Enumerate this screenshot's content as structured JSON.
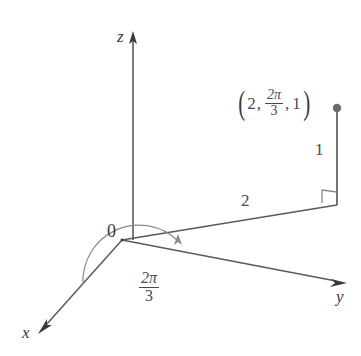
{
  "figure": {
    "background_color": "#ffffff",
    "line_color": "#5a5a5a",
    "text_color": "#3a3a3a",
    "origin_label": "0",
    "axes": [
      {
        "name": "z",
        "label": "z",
        "direction": "up"
      },
      {
        "name": "y",
        "label": "y",
        "direction": "right-down"
      },
      {
        "name": "x",
        "label": "x",
        "direction": "left-down"
      }
    ],
    "point": {
      "label_full": "(2, 2π/3, 1)",
      "open_paren": "(",
      "close_paren": ")",
      "r": "2",
      "theta_numerator": "2π",
      "theta_denominator": "3",
      "z": "1",
      "comma": ","
    },
    "angle": {
      "numerator": "2π",
      "denominator": "3",
      "symbol_pi": "π"
    },
    "segments": [
      {
        "name": "radial-segment",
        "label": "2"
      },
      {
        "name": "vertical-segment",
        "label": "1"
      }
    ],
    "right_angle_marker": "right-angle"
  }
}
